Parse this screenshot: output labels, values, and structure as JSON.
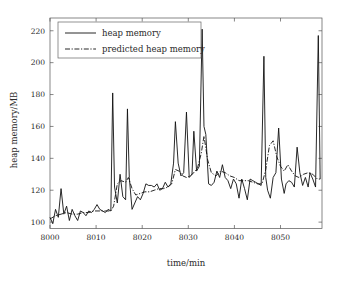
{
  "chart_data": {
    "type": "line",
    "title": "",
    "xlabel": "time/min",
    "ylabel": "heap memory/MB",
    "xlim": [
      8000,
      8059
    ],
    "ylim": [
      96,
      228
    ],
    "xticks": [
      8000,
      8010,
      8020,
      8030,
      8040,
      8050
    ],
    "xticklabels": [
      "8000",
      "8010",
      "8020",
      "8030",
      "8040",
      "8050"
    ],
    "yticks": [
      100,
      120,
      140,
      160,
      180,
      200,
      220
    ],
    "yticklabels": [
      "100",
      "120",
      "140",
      "160",
      "180",
      "200",
      "220"
    ],
    "grid": false,
    "legend_position": "upper left",
    "series": [
      {
        "name": "heap memory",
        "style": "solid",
        "color": "#111111",
        "x": [
          8000,
          8000.6,
          8001.2,
          8001.8,
          8002.4,
          8003.0,
          8003.6,
          8004.2,
          8004.8,
          8005.4,
          8006.0,
          8006.6,
          8007.2,
          8007.8,
          8008.4,
          8009.0,
          8009.6,
          8010.2,
          8010.8,
          8011.4,
          8012.0,
          8012.6,
          8013.2,
          8013.6,
          8014.0,
          8014.6,
          8015.2,
          8015.8,
          8016.4,
          8016.8,
          8017.2,
          8017.8,
          8018.4,
          8019.0,
          8019.6,
          8020.2,
          8020.8,
          8021.4,
          8022.0,
          8022.6,
          8023.2,
          8023.8,
          8024.4,
          8025.0,
          8025.6,
          8026.2,
          8026.8,
          8027.2,
          8027.8,
          8028.4,
          8029.0,
          8029.6,
          8030.2,
          8030.8,
          8031.2,
          8031.8,
          8032.4,
          8033.0,
          8033.4,
          8033.8,
          8034.4,
          8035.0,
          8035.6,
          8036.2,
          8036.8,
          8037.4,
          8038.0,
          8038.6,
          8039.2,
          8039.8,
          8040.4,
          8041.0,
          8041.6,
          8042.2,
          8042.8,
          8043.4,
          8044.0,
          8044.6,
          8045.2,
          8045.8,
          8046.4,
          8046.8,
          8047.2,
          8047.8,
          8048.4,
          8049.0,
          8049.6,
          8050.2,
          8050.8,
          8051.2,
          8051.8,
          8052.4,
          8053.0,
          8053.6,
          8054.2,
          8054.8,
          8055.4,
          8056.0,
          8056.4,
          8057.0,
          8057.6,
          8058.2,
          8058.6
        ],
        "y": [
          103,
          99,
          108,
          103,
          121,
          105,
          110,
          101,
          108,
          104,
          101,
          107,
          106,
          104,
          107,
          106,
          108,
          111,
          108,
          107,
          106,
          108,
          107,
          181,
          122,
          112,
          130,
          116,
          114,
          171,
          128,
          108,
          112,
          116,
          114,
          118,
          124,
          123,
          123,
          122,
          124,
          120,
          121,
          125,
          122,
          124,
          137,
          163,
          137,
          129,
          131,
          169,
          128,
          130,
          157,
          132,
          135,
          221,
          160,
          155,
          124,
          123,
          125,
          132,
          128,
          136,
          128,
          126,
          121,
          127,
          124,
          115,
          127,
          121,
          114,
          127,
          126,
          125,
          124,
          123,
          204,
          128,
          120,
          115,
          128,
          131,
          159,
          127,
          118,
          124,
          126,
          125,
          122,
          147,
          131,
          123,
          128,
          122,
          131,
          127,
          122,
          217,
          127
        ]
      },
      {
        "name": "predicted heap memory",
        "style": "dash-dot",
        "color": "#111111",
        "x": [
          8000,
          8001.2,
          8002.4,
          8003.6,
          8004.8,
          8006.0,
          8007.2,
          8008.4,
          8009.6,
          8010.8,
          8012.0,
          8013.2,
          8013.8,
          8014.6,
          8015.4,
          8016.4,
          8017.0,
          8017.8,
          8018.6,
          8019.6,
          8020.6,
          8021.6,
          8022.6,
          8023.6,
          8024.6,
          8025.6,
          8026.4,
          8027.2,
          8028.0,
          8028.8,
          8029.6,
          8030.4,
          8031.2,
          8032.0,
          8032.8,
          8033.4,
          8034.2,
          8035.0,
          8036.0,
          8037.0,
          8038.0,
          8039.0,
          8040.0,
          8041.0,
          8042.0,
          8043.0,
          8044.0,
          8045.0,
          8046.0,
          8046.8,
          8047.6,
          8048.4,
          8049.2,
          8050.0,
          8050.8,
          8051.6,
          8052.4,
          8053.2,
          8054.0,
          8055.0,
          8056.0,
          8057.0,
          8058.0,
          8058.6
        ],
        "y": [
          102,
          104,
          105,
          106,
          105,
          105,
          106,
          106,
          107,
          107,
          107,
          107,
          110,
          124,
          126,
          125,
          128,
          121,
          117,
          118,
          119,
          119,
          120,
          121,
          121,
          122,
          124,
          133,
          132,
          129,
          128,
          129,
          131,
          134,
          143,
          154,
          139,
          131,
          129,
          132,
          131,
          129,
          128,
          126,
          126,
          126,
          125,
          124,
          124,
          133,
          148,
          151,
          141,
          135,
          132,
          136,
          132,
          129,
          128,
          130,
          131,
          130,
          127,
          127
        ]
      }
    ],
    "legend": [
      {
        "label": "heap memory",
        "style": "solid"
      },
      {
        "label": "predicted heap memory",
        "style": "dash-dot"
      }
    ]
  }
}
